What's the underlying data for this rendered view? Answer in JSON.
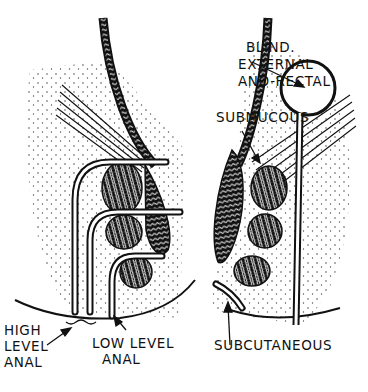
{
  "figure": {
    "ink_color": "#111111",
    "background": "#ffffff",
    "labels": {
      "blind_line1": "BLIND.",
      "blind_line2": "EXTERNAL",
      "blind_line3": "ANO-RECTAL",
      "submucous": "SUBMUCOUS",
      "high_line1": "HIGH",
      "high_line2": "LEVEL",
      "high_line3": "ANAL",
      "low_line1": "LOW LEVEL",
      "low_line2": "ANAL",
      "subcutaneous": "SUBCUTANEOUS"
    }
  }
}
